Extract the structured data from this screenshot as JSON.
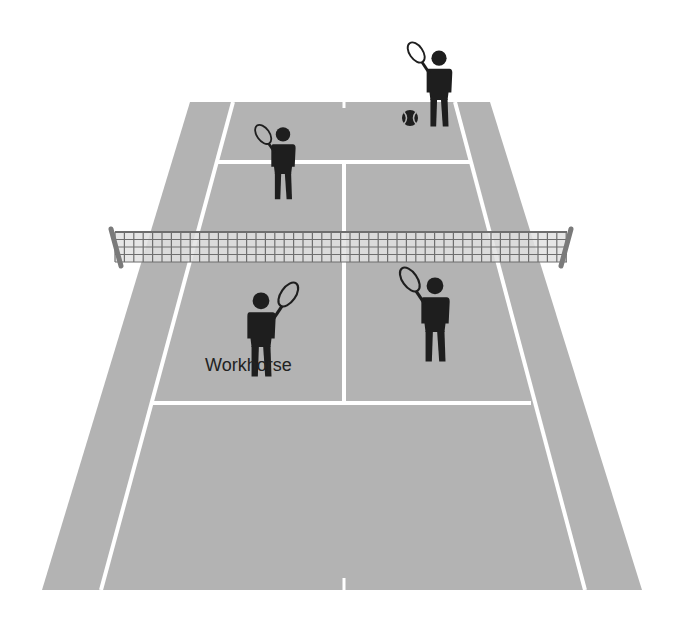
{
  "colors": {
    "court": "#b3b3b3",
    "lines": "#ffffff",
    "player": "#1e1e1e",
    "net_mesh": "#6e6e6e",
    "net_post": "#7a7a7a",
    "background": "#ffffff"
  },
  "players": [
    {
      "id": "far-server",
      "side": "far",
      "role": "server behind baseline",
      "racket_hand": "right"
    },
    {
      "id": "far-net",
      "side": "far",
      "role": "at service line",
      "racket_hand": "right"
    },
    {
      "id": "near-left",
      "side": "near",
      "role": "deuce court",
      "racket_hand": "left",
      "label": "Workhorse"
    },
    {
      "id": "near-right",
      "side": "near",
      "role": "ad court near net",
      "racket_hand": "right"
    }
  ],
  "labels": {
    "workhorse": "Workhorse"
  },
  "ball": {
    "present": true,
    "side": "far"
  }
}
